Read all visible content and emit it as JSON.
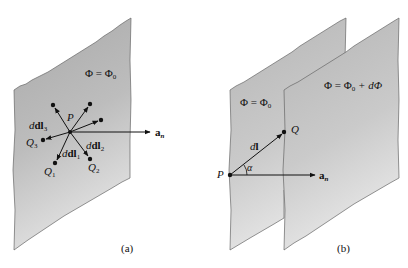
{
  "figure_a": {
    "plane_label": "Φ = Φ₀",
    "point_P": "P",
    "vectors": [
      {
        "label": "dl₁",
        "end": "Q₁"
      },
      {
        "label": "dl₂",
        "end": "Q₂"
      },
      {
        "label": "dl₃",
        "end": "Q₃"
      }
    ],
    "labels": {
      "P": "P",
      "Q1": "Q",
      "Q1_sub": "1",
      "Q2": "Q",
      "Q2_sub": "2",
      "Q3": "Q",
      "Q3_sub": "3",
      "dl1": "dl",
      "dl1_sub": "1",
      "dl2": "dl",
      "dl2_sub": "2",
      "dl3": "dl",
      "dl3_sub": "3",
      "phi": "Φ = Φ",
      "phi_sub": "0",
      "an": "a",
      "an_sub": "n"
    },
    "caption": "(a)"
  },
  "figure_b": {
    "labels": {
      "phi_back": "Φ = Φ",
      "phi_back_sub": "0",
      "phi_front": "Φ = Φ",
      "phi_front_sub": "0",
      "phi_front_suffix": " + dΦ",
      "P": "P",
      "Q": "Q",
      "dl": "dl",
      "alpha": "α",
      "an": "a",
      "an_sub": "n"
    },
    "caption": "(b)"
  },
  "colors": {
    "plane_fill": "#c4c4c4",
    "plane_light": "#e0e0e0",
    "edge": "#555555",
    "ink": "#111111"
  }
}
